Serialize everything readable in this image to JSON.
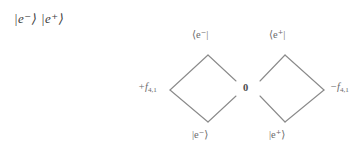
{
  "figure": {
    "header": {
      "state_pair": "|e⁻⟩ |e⁺⟩"
    },
    "left_diamond": {
      "top_label": "⟨e⁻|",
      "bottom_label": "|e⁻⟩",
      "left_label": "+f",
      "left_label_sub": "4,1"
    },
    "right_diamond": {
      "top_label": "⟨e⁺|",
      "bottom_label": "|e⁺⟩",
      "right_label": "−f",
      "right_label_sub": "4,1"
    },
    "center": {
      "value": "0"
    },
    "colors": {
      "line": "#8a8a8a",
      "text": "#6b6b6b",
      "text_dark": "#3d3d3d",
      "background": "#ffffff"
    }
  }
}
